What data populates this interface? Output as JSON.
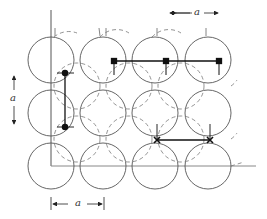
{
  "diagram": {
    "type": "lattice-of-circles",
    "grid": {
      "cols": 4,
      "rows": 3,
      "spacing_label": "a"
    },
    "labels": {
      "top_spacing": "a",
      "left_spacing": "a",
      "bottom_spacing": "a"
    },
    "colors": {
      "stroke": "#555555",
      "marker": "#111111",
      "background": "#ffffff"
    },
    "annotations": [
      {
        "kind": "vertical-bond",
        "marker": "dot",
        "location": "between column 1 rows 1-2"
      },
      {
        "kind": "horizontal-bond",
        "marker": "square",
        "location": "top row columns 2-4"
      },
      {
        "kind": "horizontal-bond",
        "marker": "cross",
        "location": "between rows 2-3, columns 3-4"
      }
    ]
  }
}
